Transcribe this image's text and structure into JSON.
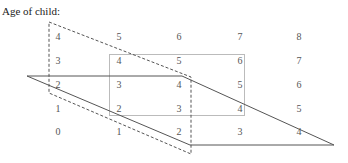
{
  "title": "Age of child:",
  "grid": {
    "columns_x": [
      58,
      119,
      179,
      240,
      299
    ],
    "rows_y": [
      38,
      62,
      86,
      110,
      133
    ],
    "rows": [
      [
        "4",
        "5",
        "6",
        "7",
        "8"
      ],
      [
        "3",
        "4",
        "5",
        "6",
        "7"
      ],
      [
        "2",
        "3",
        "4",
        "5",
        "6"
      ],
      [
        "1",
        "2",
        "3",
        "4",
        "5"
      ],
      [
        "0",
        "1",
        "2",
        "3",
        "4"
      ]
    ]
  },
  "shapes": {
    "dashed_parallelogram": {
      "points": [
        [
          49,
          22
        ],
        [
          191,
          77
        ],
        [
          191,
          154
        ],
        [
          49,
          93
        ]
      ],
      "color": "#555555"
    },
    "solid_parallelogram": {
      "points": [
        [
          27,
          76
        ],
        [
          182,
          76
        ],
        [
          334,
          144
        ],
        [
          190,
          144
        ],
        [
          190,
          147
        ]
      ],
      "color": "#555555"
    },
    "gray_rectangle": {
      "x": 109,
      "y": 54,
      "width": 135,
      "height": 61,
      "color": "#bbbbbb"
    }
  }
}
